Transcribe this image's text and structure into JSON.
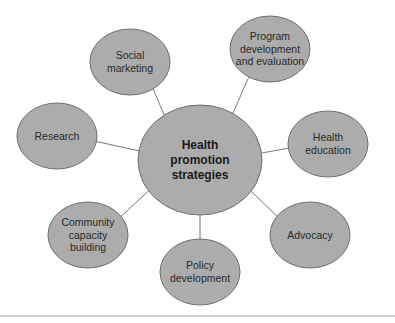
{
  "diagram": {
    "type": "hub-and-spoke",
    "center": {
      "id": "center",
      "lines": [
        "Health",
        "promotion",
        "strategies"
      ],
      "cx": 200,
      "cy": 160,
      "rx": 62,
      "ry": 55
    },
    "nodes": [
      {
        "id": "social-marketing",
        "lines": [
          "Social",
          "marketing"
        ],
        "cx": 130,
        "cy": 62,
        "rx": 40,
        "ry": 33
      },
      {
        "id": "program-development",
        "lines": [
          "Program",
          "development",
          "and evaluation"
        ],
        "cx": 270,
        "cy": 49,
        "rx": 40,
        "ry": 33
      },
      {
        "id": "research",
        "lines": [
          "Research"
        ],
        "cx": 57,
        "cy": 136,
        "rx": 40,
        "ry": 33
      },
      {
        "id": "health-education",
        "lines": [
          "Health",
          "education"
        ],
        "cx": 328,
        "cy": 144,
        "rx": 40,
        "ry": 33
      },
      {
        "id": "community-capacity-building",
        "lines": [
          "Community",
          "capacity",
          "building"
        ],
        "cx": 88,
        "cy": 235,
        "rx": 40,
        "ry": 33
      },
      {
        "id": "policy-development",
        "lines": [
          "Policy",
          "development"
        ],
        "cx": 200,
        "cy": 272,
        "rx": 40,
        "ry": 33
      },
      {
        "id": "advocacy",
        "lines": [
          "Advocacy"
        ],
        "cx": 310,
        "cy": 235,
        "rx": 40,
        "ry": 33
      }
    ],
    "colors": {
      "node_fill": "#acacac",
      "node_stroke": "#6e6e6e",
      "edge": "#6a6a6a",
      "text": "#2a2a2a",
      "rule": "#9a9a9a"
    }
  }
}
